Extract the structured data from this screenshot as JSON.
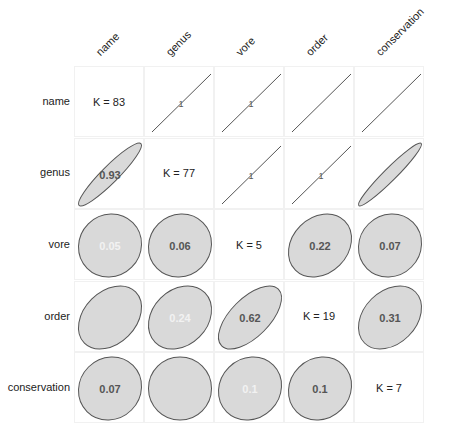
{
  "chart_data": {
    "type": "heatmap",
    "subtype": "correlation-ellipse-matrix",
    "title": "",
    "variables": [
      "name",
      "genus",
      "vore",
      "order",
      "conservation"
    ],
    "diagonal": [
      "K = 83",
      "K = 77",
      "K = 5",
      "K = 19",
      "K = 7"
    ],
    "lower_triangle": [
      {
        "row": "genus",
        "col": "name",
        "value": 0.93,
        "label": "0.93",
        "label_visible": true
      },
      {
        "row": "vore",
        "col": "name",
        "value": 0.05,
        "label": "0.05",
        "label_visible": false
      },
      {
        "row": "vore",
        "col": "genus",
        "value": 0.06,
        "label": "0.06",
        "label_visible": true
      },
      {
        "row": "order",
        "col": "name",
        "value": 0.32,
        "label": "",
        "label_visible": false
      },
      {
        "row": "order",
        "col": "genus",
        "value": 0.24,
        "label": "0.24",
        "label_visible": false
      },
      {
        "row": "order",
        "col": "vore",
        "value": 0.62,
        "label": "0.62",
        "label_visible": true
      },
      {
        "row": "conservation",
        "col": "name",
        "value": 0.07,
        "label": "0.07",
        "label_visible": true
      },
      {
        "row": "conservation",
        "col": "genus",
        "value": 0.0,
        "label": "",
        "label_visible": false
      },
      {
        "row": "conservation",
        "col": "vore",
        "value": 0.1,
        "label": "0.1",
        "label_visible": false
      },
      {
        "row": "conservation",
        "col": "order",
        "value": 0.1,
        "label": "0.1",
        "label_visible": true
      }
    ],
    "upper_triangle": [
      {
        "row": "name",
        "col": "genus",
        "value": 1,
        "label": "1"
      },
      {
        "row": "name",
        "col": "vore",
        "value": 1,
        "label": "1"
      },
      {
        "row": "name",
        "col": "order",
        "value": 1,
        "label": ""
      },
      {
        "row": "name",
        "col": "conservation",
        "value": 1,
        "label": ""
      },
      {
        "row": "genus",
        "col": "vore",
        "value": 1,
        "label": "1"
      },
      {
        "row": "genus",
        "col": "order",
        "value": 1,
        "label": "1"
      },
      {
        "row": "genus",
        "col": "conservation",
        "value": 0.96,
        "label": "",
        "ellipse": true
      },
      {
        "row": "vore",
        "col": "order",
        "value": 0.22,
        "label": "0.22",
        "ellipse": true
      },
      {
        "row": "vore",
        "col": "conservation",
        "value": 0.07,
        "label": "0.07",
        "ellipse": true
      },
      {
        "row": "order",
        "col": "conservation",
        "value": 0.31,
        "label": "0.31",
        "ellipse": true
      }
    ],
    "colors": {
      "ellipse_fill": "#d9d9d9",
      "ellipse_stroke": "#555555",
      "value_text": "#555555",
      "faint_text": "#f2f2f2",
      "grid": "#f1f1f1"
    },
    "xlabel": "",
    "ylabel": "",
    "grid": true,
    "legend": "none"
  }
}
